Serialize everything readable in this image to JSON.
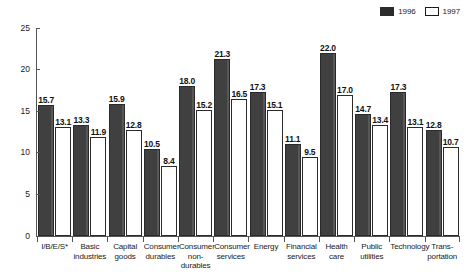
{
  "chart_data": {
    "type": "bar",
    "title": "",
    "subtitle": "",
    "xlabel": "",
    "ylabel": "",
    "ylim": [
      0,
      25
    ],
    "yticks": [
      "0",
      "5",
      "10",
      "15",
      "20",
      "25"
    ],
    "grid": false,
    "legend_position": "top-right",
    "categories": [
      "I/B/E/S*",
      "Basic industries",
      "Capital goods",
      "Consumer durables",
      "Consumer non-durables",
      "Consumer services",
      "Energy",
      "Financial services",
      "Health care",
      "Public utilities",
      "Technology",
      "Transportation"
    ],
    "category_lines": [
      [
        "I/B/E/S*"
      ],
      [
        "Basic",
        "industries"
      ],
      [
        "Capital",
        "goods"
      ],
      [
        "Consumer",
        "durables"
      ],
      [
        "Consumer",
        "non-",
        "durables"
      ],
      [
        "Consumer",
        "services"
      ],
      [
        "Energy"
      ],
      [
        "Financial",
        "services"
      ],
      [
        "Health",
        "care"
      ],
      [
        "Public",
        "utilities"
      ],
      [
        "Technology"
      ],
      [
        "Trans-",
        "portation"
      ]
    ],
    "series": [
      {
        "name": "1996",
        "color": "#404040",
        "values": [
          15.7,
          13.3,
          15.9,
          10.5,
          18.0,
          21.3,
          17.3,
          11.1,
          22.0,
          14.7,
          17.3,
          12.8
        ],
        "labels": [
          "15.7",
          "13.3",
          "15.9",
          "10.5",
          "18.0",
          "21.3",
          "17.3",
          "11.1",
          "22.0",
          "14.7",
          "17.3",
          "12.8"
        ]
      },
      {
        "name": "1997",
        "color": "#ffffff",
        "values": [
          13.1,
          11.9,
          12.8,
          8.4,
          15.2,
          16.5,
          15.1,
          9.5,
          17.0,
          13.4,
          13.1,
          10.7
        ],
        "labels": [
          "13.1",
          "11.9",
          "12.8",
          "8.4",
          "15.2",
          "16.5",
          "15.1",
          "9.5",
          "17.0",
          "13.4",
          "13.1",
          "10.7"
        ]
      }
    ]
  },
  "legend": {
    "items": [
      {
        "label": "1996",
        "style": "filled"
      },
      {
        "label": "1997",
        "style": "hollow"
      }
    ]
  },
  "colors": {
    "bar_1996": "#404040",
    "bar_1997": "#ffffff",
    "axis": "#555555",
    "text": "#1a1a1a",
    "background": "#ffffff"
  }
}
